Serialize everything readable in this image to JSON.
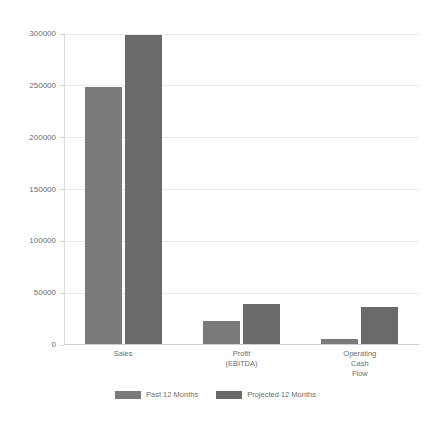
{
  "chart_data": {
    "type": "bar",
    "title": "",
    "subtitle": "",
    "xlabel": "",
    "ylabel": "",
    "categories": [
      "Sales",
      "Profit\n(EBITDA)",
      "Operating\nCash\nFlow"
    ],
    "category_lines": [
      [
        "Sales"
      ],
      [
        "Profit",
        "(EBITDA)"
      ],
      [
        "Operating",
        "Cash",
        "Flow"
      ]
    ],
    "series": [
      {
        "name": "Past 12 Months",
        "color": "#7a7a7a",
        "values": [
          248000,
          22000,
          4500
        ]
      },
      {
        "name": "Projected 12 Months",
        "color": "#6a6a6a",
        "values": [
          298000,
          38500,
          36000
        ]
      }
    ],
    "ylim": [
      0,
      300000
    ],
    "ytick_values": [
      0,
      50000,
      100000,
      150000,
      200000,
      250000,
      300000
    ],
    "ytick_labels": [
      "0",
      "50000",
      "100000",
      "150000",
      "200000",
      "250000",
      "300000"
    ],
    "grid": true,
    "grid_axis": "y",
    "legend_position": "bottom",
    "background_color": "#ffffff",
    "grid_color": "#e9e9e9",
    "axis_color": "#cfcfcf",
    "text_color": "#6e6e6e"
  },
  "legend": {
    "items": [
      {
        "label": "Past 12 Months"
      },
      {
        "label": "Projected 12 Months"
      }
    ]
  }
}
